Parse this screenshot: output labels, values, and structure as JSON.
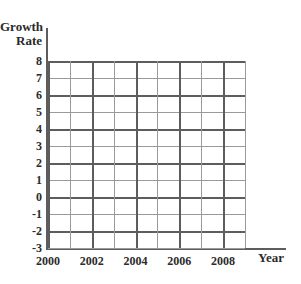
{
  "chart_data": {
    "type": "line",
    "title": "",
    "subtitle": "",
    "xlabel": "Year",
    "ylabel": "Growth Rate",
    "ylabel_lines": [
      "Growth",
      "Rate"
    ],
    "xlim": [
      2000,
      2009
    ],
    "ylim": [
      -3,
      8
    ],
    "y_ticks": [
      8,
      7,
      6,
      5,
      4,
      3,
      2,
      1,
      0,
      -1,
      -2,
      -3
    ],
    "y_tick_labels": [
      "8",
      "7",
      "6",
      "5",
      "4",
      "3",
      "2",
      "1",
      "0",
      "-1",
      "-2",
      "-3"
    ],
    "x_ticks": [
      2000,
      2001,
      2002,
      2003,
      2004,
      2005,
      2006,
      2007,
      2008,
      2009
    ],
    "x_tick_labels_shown": [
      "2000",
      "2002",
      "2004",
      "2006",
      "2008"
    ],
    "x_labeled_ticks": [
      2000,
      2002,
      2004,
      2006,
      2008
    ],
    "grid": true,
    "grid_major_y": [
      8,
      6,
      4,
      2,
      0,
      -2
    ],
    "grid_major_x": [
      2000,
      2002,
      2004,
      2006,
      2008
    ],
    "legend": null,
    "series": [],
    "values": [],
    "categories": [],
    "annotations": [],
    "note": "Empty grid template; no data plotted."
  },
  "colors": {
    "background": "#ffffff",
    "grid_minor": "#9a9a9a",
    "grid_major": "#5d5d5d",
    "axis": "#5d5d5d",
    "text": "#2b2b2b"
  }
}
